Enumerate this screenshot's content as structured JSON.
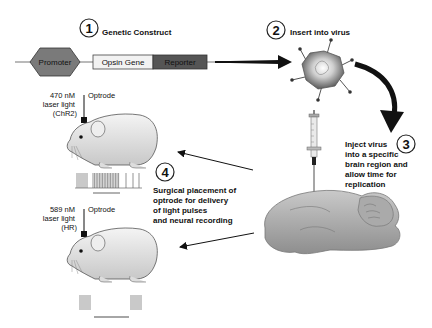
{
  "steps": [
    {
      "number": "1",
      "title": "Genetic Construct"
    },
    {
      "number": "2",
      "title": "Insert into virus"
    },
    {
      "number": "3",
      "lines": [
        "Inject virus",
        "into a specific",
        "brain region and",
        "allow time for",
        "replication"
      ]
    },
    {
      "number": "4",
      "lines": [
        "Surgical placement of",
        "optrode for delivery",
        "of light pulses",
        "and neural recording"
      ]
    }
  ],
  "construct": {
    "promoter": "Promoter",
    "opsin": "Opsin Gene",
    "reporter": "Reporter"
  },
  "mouse_top": {
    "laser_lines": [
      "470 nM",
      "laser light",
      "(ChR2)"
    ],
    "optrode": "Optrode"
  },
  "mouse_bottom": {
    "laser_lines": [
      "589 nM",
      "laser light",
      "(HR)"
    ],
    "optrode": "Optrode"
  },
  "colors": {
    "promoter": "#7a7a7a",
    "opsin": "#f2f2f2",
    "reporter": "#555555",
    "arrow": "#111111"
  }
}
